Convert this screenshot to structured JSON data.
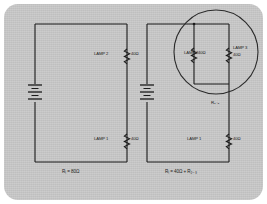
{
  "figure": {
    "panel_color": "#c9c9c9",
    "ink_color": "#1b1b1b"
  },
  "circuit_left": {
    "name": "Series circuit",
    "battery": "battery-symbol",
    "lamp_top": {
      "name": "LAMP 2",
      "resistance": "40Ω"
    },
    "lamp_bottom": {
      "name": "LAMP 1",
      "resistance": "40Ω"
    },
    "total": "Rₜ = 80Ω"
  },
  "circuit_right": {
    "name": "Series-parallel circuit",
    "battery": "battery-symbol",
    "lamp_parallel_left": {
      "name": "LAMP 2",
      "resistance": "40Ω"
    },
    "lamp_parallel_right": {
      "name": "LAMP 3",
      "resistance": "40Ω"
    },
    "lamp_series": {
      "name": "LAMP 1",
      "resistance": "40Ω"
    },
    "parallel_group_label": "R₂₋₃",
    "total": "Rₜ = 40Ω + R₂₋₃"
  },
  "annotations": {
    "circle_highlight": "parallel-branch-highlight"
  }
}
